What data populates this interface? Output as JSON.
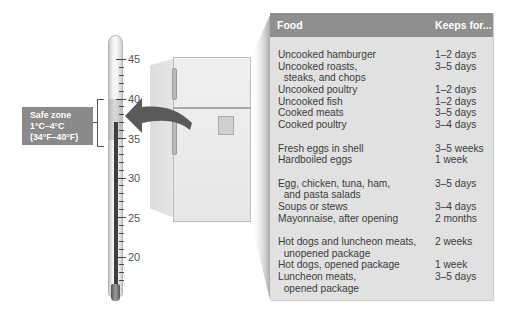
{
  "thermometer": {
    "scale_labels": [
      "45",
      "40",
      "35",
      "30",
      "25",
      "20"
    ],
    "safe_zone": {
      "title": "Safe zone",
      "celsius": "1°C–4°C",
      "fahrenheit": "(34°F–40°F)"
    }
  },
  "table": {
    "headers": {
      "food": "Food",
      "keeps_for": "Keeps for..."
    },
    "groups": [
      [
        {
          "food": "Uncooked hamburger",
          "keeps": "1–2 days"
        },
        {
          "food": "Uncooked roasts,\n  steaks, and chops",
          "keeps": "3–5 days"
        },
        {
          "food": "Uncooked poultry",
          "keeps": "1–2 days"
        },
        {
          "food": "Uncooked fish",
          "keeps": "1–2 days"
        },
        {
          "food": "Cooked meats",
          "keeps": "3–5 days"
        },
        {
          "food": "Cooked poultry",
          "keeps": "3–4 days"
        }
      ],
      [
        {
          "food": "Fresh eggs in shell",
          "keeps": "3–5 weeks"
        },
        {
          "food": "Hardboiled eggs",
          "keeps": "1 week"
        }
      ],
      [
        {
          "food": "Egg, chicken, tuna, ham,\n  and pasta salads",
          "keeps": "3–5 days"
        },
        {
          "food": "Soups or stews",
          "keeps": "3–4 days"
        },
        {
          "food": "Mayonnaise, after opening",
          "keeps": "2 months"
        }
      ],
      [
        {
          "food": "Hot dogs and luncheon meats,\n  unopened package",
          "keeps": "2 weeks"
        },
        {
          "food": "Hot dogs, opened package",
          "keeps": "1 week"
        },
        {
          "food": "Luncheon meats,\n  opened package",
          "keeps": "3–5 days"
        }
      ]
    ]
  },
  "colors": {
    "panel_bg": "#e1e1e1",
    "header_bg": "#8f8f8f",
    "safe_box": "#8a8a8a",
    "arrow": "#5a5a5a"
  }
}
